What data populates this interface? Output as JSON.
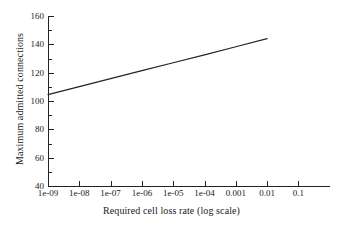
{
  "chart_data": {
    "type": "line",
    "title": "",
    "xlabel": "Required cell loss rate (log scale)",
    "ylabel": "Maximum admitted connections",
    "x_scale": "log",
    "xticklabels": [
      "1e-09",
      "1e-08",
      "1e-07",
      "1e-06",
      "1e-05",
      "1e-04",
      "0.001",
      "0.01",
      "0.1"
    ],
    "xtickvalues": [
      1e-09,
      1e-08,
      1e-07,
      1e-06,
      1e-05,
      0.0001,
      0.001,
      0.01,
      0.1
    ],
    "yticklabels": [
      "40",
      "60",
      "80",
      "100",
      "120",
      "140",
      "160"
    ],
    "ytickvalues": [
      40,
      60,
      80,
      100,
      120,
      140,
      160
    ],
    "y_minor_ticks": [
      50,
      70,
      90,
      110,
      130,
      150
    ],
    "ylim": [
      40,
      160
    ],
    "xlim": [
      1e-09,
      1
    ],
    "grid": false,
    "legend": null,
    "series": [
      {
        "name": "maximum admitted connections",
        "color": "#232323",
        "x": [
          1e-09,
          1e-08,
          1e-07,
          1e-06,
          1e-05,
          0.0001,
          0.001,
          0.01
        ],
        "values": [
          104.5,
          110.2,
          115.8,
          121.4,
          127.0,
          132.6,
          138.3,
          144.0
        ]
      }
    ]
  },
  "figure": {
    "background_color": "#ffffff",
    "axis_color": "#232323",
    "text_color": "#1a1a1a"
  }
}
